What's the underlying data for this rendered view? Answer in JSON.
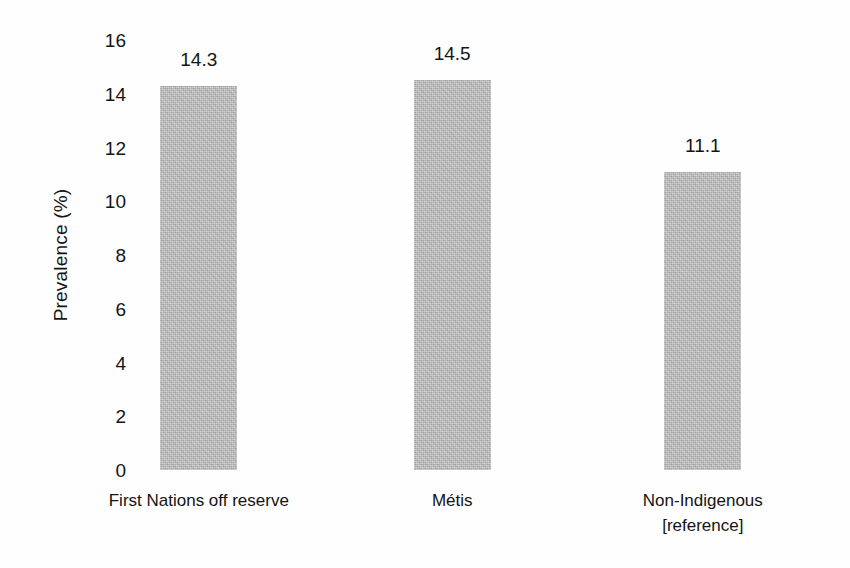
{
  "chart_data": {
    "type": "bar",
    "title": "",
    "subtitle": "",
    "xlabel": "",
    "ylabel": "Prevalence (%)",
    "ylim": [
      0,
      16
    ],
    "ytick_step": 2,
    "yticks": [
      "16",
      "14",
      "12",
      "10",
      "8",
      "6",
      "4",
      "2",
      "0"
    ],
    "ytick_values": [
      16,
      14,
      12,
      10,
      8,
      6,
      4,
      2,
      0
    ],
    "grid": false,
    "legend": false,
    "legend_position": "none",
    "categories": [
      "First Nations off reserve",
      "Métis",
      "Non-Indigenous [reference]"
    ],
    "category_lines": [
      [
        "First Nations off reserve"
      ],
      [
        "Métis"
      ],
      [
        "Non-Indigenous",
        "[reference]"
      ]
    ],
    "values": [
      14.3,
      14.5,
      11.1
    ],
    "value_labels": [
      "14.3",
      "14.5",
      "11.1"
    ],
    "bar_color": "#b4b4b4",
    "text_color": "#141414",
    "background_color": "#ffffff"
  },
  "bars": [
    {
      "label": "First Nations off reserve",
      "value": 14.3,
      "value_label": "14.3",
      "center_pct": 8.4,
      "width_px": 77
    },
    {
      "label": "Métis",
      "value": 14.5,
      "value_label": "14.5",
      "center_pct": 44.6,
      "width_px": 77
    },
    {
      "label": "Non-Indigenous [reference]",
      "value": 11.1,
      "value_label": "11.1",
      "center_pct": 80.4,
      "width_px": 77
    }
  ]
}
